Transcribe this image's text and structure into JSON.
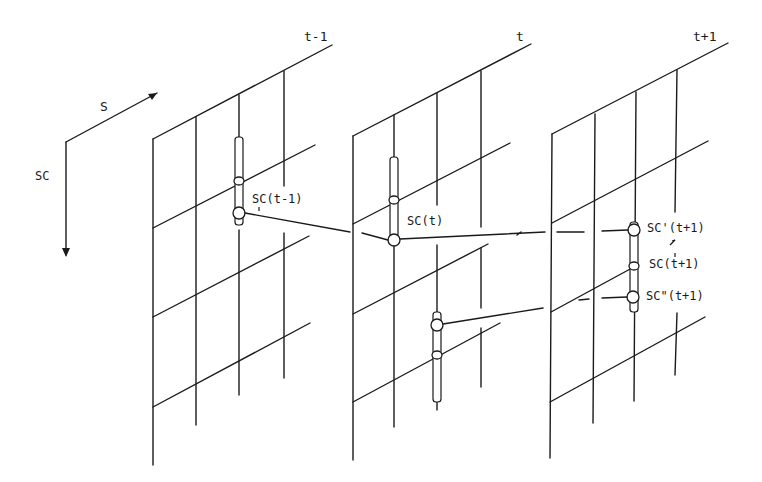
{
  "figure": {
    "axes": {
      "s_label": "S",
      "sc_label": "SC"
    },
    "frames": [
      {
        "label": "t-1"
      },
      {
        "label": "t"
      },
      {
        "label": "t+1"
      }
    ],
    "nodes": {
      "sc_t_minus_1": "SC(t-1)",
      "sc_t": "SC(t)",
      "sc_prime_t_plus_1": "SC'(t+1)",
      "sc_t_plus_1": "SC(t+1)",
      "sc_double_prime_t_plus_1": "SC\"(t+1)"
    }
  }
}
